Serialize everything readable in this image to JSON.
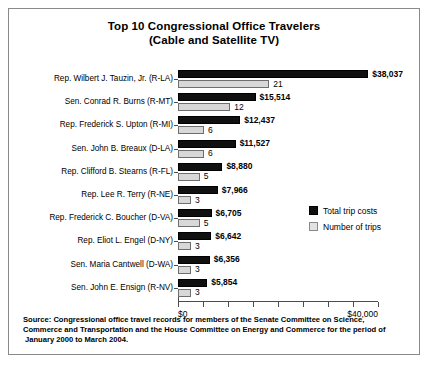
{
  "chart_data": {
    "type": "bar",
    "orientation": "horizontal",
    "title": "Top 10 Congressional Office Travelers (Cable and Satellite TV)",
    "title_lines": [
      "Top 10 Congressional Office Travelers",
      "(Cable and Satellite TV)"
    ],
    "categories": [
      "Rep. Wilbert J. Tauzin, Jr. (R-LA)",
      "Sen. Conrad R. Burns (R-MT)",
      "Rep. Frederick S. Upton (R-MI)",
      "Sen. John B. Breaux (D-LA)",
      "Rep. Clifford B. Stearns (R-FL)",
      "Rep. Lee R. Terry (R-NE)",
      "Rep. Frederick C. Boucher (D-VA)",
      "Rep. Eliot L. Engel (D-NY)",
      "Sen. Maria Cantwell (D-WA)",
      "Sen. John E. Ensign (R-NV)"
    ],
    "series": [
      {
        "name": "Total trip costs",
        "key": "cost",
        "color": "#101010",
        "values": [
          38037,
          15514,
          12437,
          11527,
          8880,
          7966,
          6705,
          6642,
          6356,
          5854
        ],
        "labels": [
          "$38,037",
          "$15,514",
          "$12,437",
          "$11,527",
          "$8,880",
          "$7,966",
          "$6,705",
          "$6,642",
          "$6,356",
          "$5,854"
        ]
      },
      {
        "name": "Number of trips",
        "key": "trips",
        "color": "#d8d8d8",
        "values": [
          21,
          12,
          6,
          6,
          5,
          3,
          5,
          3,
          3,
          3
        ],
        "labels": [
          "21",
          "12",
          "6",
          "6",
          "5",
          "3",
          "5",
          "3",
          "3",
          "3"
        ]
      }
    ],
    "xlabel": "",
    "ylabel": "",
    "xlim": [
      0,
      40000
    ],
    "xticks": [
      0,
      5000,
      10000,
      15000,
      20000,
      25000,
      30000,
      35000,
      40000
    ],
    "xtick_labels": [
      "$0",
      "",
      "",
      "",
      "",
      "",
      "",
      "",
      "$40,000"
    ],
    "trips_max_scale": 23,
    "grid": false,
    "legend_position": "middle-right",
    "legend": [
      "Total trip costs",
      "Number of trips"
    ]
  },
  "source": {
    "lines": [
      "Source: Congressional office travel records for members of the Senate Committee on Science,",
      "Commerce and Transportation and the House Committee on Energy and Commerce for the period of",
      "January 2000 to March 2004."
    ]
  }
}
